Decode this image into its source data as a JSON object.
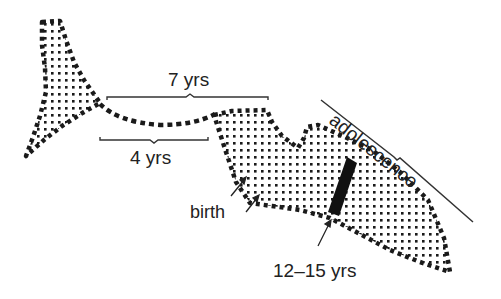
{
  "diagram": {
    "type": "development-timeline-illustration",
    "shapes": {
      "tail": {
        "name": "tail-region",
        "fill_pattern": "dotted"
      },
      "cord": {
        "name": "connecting-cord",
        "style": "dashed"
      },
      "body": {
        "name": "body-region",
        "fill_pattern": "dotted"
      },
      "band": {
        "name": "maturation-band",
        "color": "#111111"
      }
    },
    "labels": {
      "seven_years": "7 yrs",
      "four_years": "4 yrs",
      "birth": "birth",
      "twelve_fifteen": "12–15 yrs",
      "adolescence": "adolescence"
    },
    "colors": {
      "ink": "#222222",
      "background": "#ffffff"
    }
  }
}
